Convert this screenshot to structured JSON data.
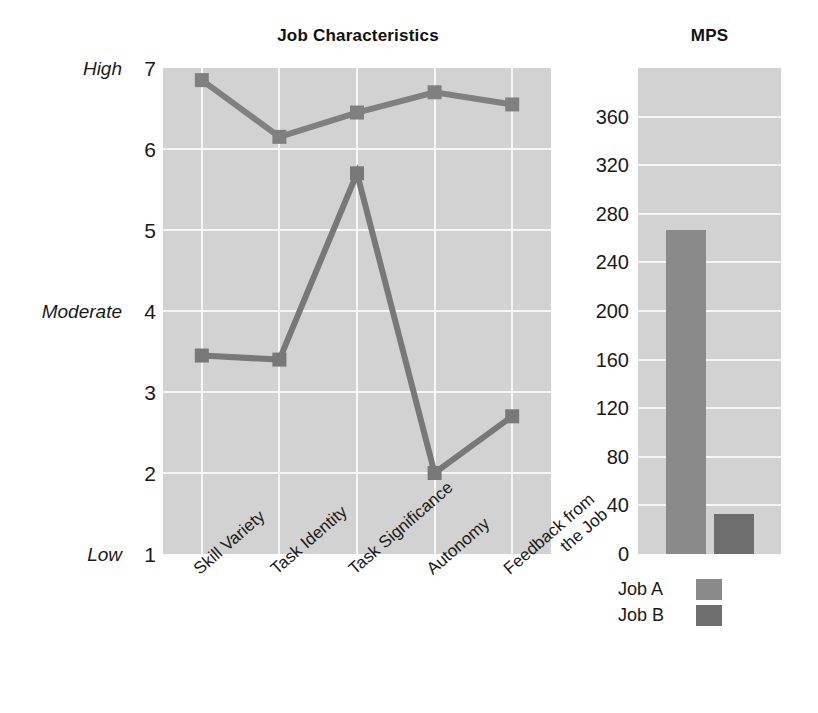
{
  "charts": {
    "line": {
      "title": "Job Characteristics"
    },
    "bar": {
      "title": "MPS"
    }
  },
  "axis_anchors": {
    "high": "High",
    "moderate": "Moderate",
    "low": "Low"
  },
  "legend": {
    "items": [
      {
        "label": "Job A",
        "color": "#8a8a8a"
      },
      {
        "label": "Job B",
        "color": "#6e6e6e"
      }
    ]
  },
  "colors": {
    "plot_background": "#d2d2d2",
    "gridline": "#f6f6f6",
    "series_job_a": "#808080",
    "series_job_b": "#787878",
    "text": "#1a1a1a"
  },
  "chart_data": [
    {
      "type": "line",
      "title": "Job Characteristics",
      "xlabel": "",
      "ylabel": "",
      "categories": [
        "Skill Variety",
        "Task Identity",
        "Task Significance",
        "Autonomy",
        "Feedback from\nthe Job"
      ],
      "yticks": [
        1,
        2,
        3,
        4,
        5,
        6,
        7
      ],
      "ytick_labels": [
        "1",
        "2",
        "3",
        "4",
        "5",
        "6",
        "7"
      ],
      "ylim": [
        1,
        7
      ],
      "y_anchor_labels": {
        "1": "Low",
        "4": "Moderate",
        "7": "High"
      },
      "grid": true,
      "legend_position": "below-right-chart",
      "series": [
        {
          "name": "Job A",
          "values": [
            6.85,
            6.15,
            6.45,
            6.7,
            6.55
          ]
        },
        {
          "name": "Job B",
          "values": [
            3.45,
            3.4,
            5.7,
            2.0,
            2.7
          ]
        }
      ]
    },
    {
      "type": "bar",
      "title": "MPS",
      "xlabel": "",
      "ylabel": "",
      "categories": [
        "Job A",
        "Job B"
      ],
      "values": [
        267,
        33
      ],
      "yticks": [
        0,
        40,
        80,
        120,
        160,
        200,
        240,
        280,
        320,
        360
      ],
      "ytick_labels": [
        "0",
        "40",
        "80",
        "120",
        "160",
        "200",
        "240",
        "280",
        "320",
        "360"
      ],
      "ylim": [
        0,
        400
      ],
      "grid": true,
      "legend_position": "below"
    }
  ]
}
